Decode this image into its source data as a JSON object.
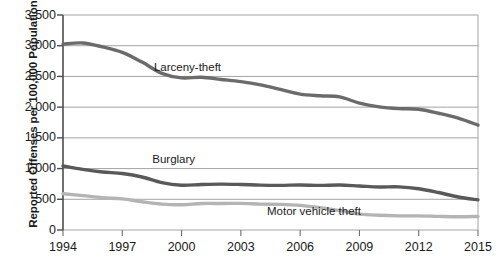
{
  "chart_data": {
    "type": "line",
    "title": "",
    "xlabel": "",
    "ylabel": "Reported Offenses per 100,000 Population",
    "xlim": [
      1994,
      2015
    ],
    "ylim": [
      0,
      3500
    ],
    "grid": true,
    "legend_position": "inline-annotations",
    "x": [
      1994,
      1995,
      1996,
      1997,
      1998,
      1999,
      2000,
      2001,
      2002,
      2003,
      2004,
      2005,
      2006,
      2007,
      2008,
      2009,
      2010,
      2011,
      2012,
      2013,
      2014,
      2015
    ],
    "y_ticks": [
      0,
      500,
      1000,
      1500,
      2000,
      2500,
      3000,
      3500
    ],
    "y_tick_labels": [
      "0",
      "500",
      "1,000",
      "1,500",
      "2,000",
      "2,500",
      "3,000",
      "3,500"
    ],
    "x_ticks": [
      1994,
      1997,
      2000,
      2003,
      2006,
      2009,
      2012,
      2015
    ],
    "x_tick_labels": [
      "1994",
      "1997",
      "2000",
      "2003",
      "2006",
      "2009",
      "2012",
      "2015"
    ],
    "series": [
      {
        "name": "Larceny-theft",
        "color": "#6b6b6b",
        "width": 3.4,
        "label_x": 2000.3,
        "label_y": 2640,
        "values": [
          3026,
          3045,
          2981,
          2892,
          2733,
          2551,
          2477,
          2486,
          2451,
          2416,
          2362,
          2288,
          2213,
          2185,
          2167,
          2065,
          2005,
          1976,
          1965,
          1901,
          1822,
          1708
        ]
      },
      {
        "name": "Burglary",
        "color": "#595959",
        "width": 3.4,
        "label_x": 1999.6,
        "label_y": 1140,
        "values": [
          1042,
          987,
          945,
          919,
          863,
          770,
          729,
          741,
          747,
          741,
          730,
          727,
          733,
          726,
          733,
          717,
          701,
          702,
          672,
          610,
          537,
          491
        ]
      },
      {
        "name": "Motor vehicle theft",
        "color": "#b4b4b4",
        "width": 3.4,
        "label_x": 2006.7,
        "label_y": 290,
        "values": [
          591,
          560,
          526,
          506,
          459,
          422,
          412,
          431,
          432,
          433,
          422,
          417,
          400,
          364,
          315,
          259,
          239,
          230,
          230,
          222,
          216,
          220
        ]
      }
    ]
  },
  "annotations": {
    "larceny": "Larceny-theft",
    "burglary": "Burglary",
    "motor_vehicle": "Motor vehicle theft"
  }
}
